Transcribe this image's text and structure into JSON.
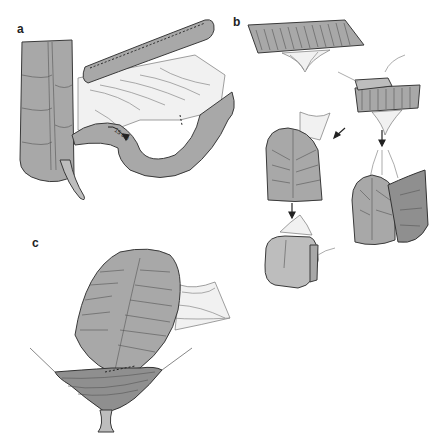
{
  "figure": {
    "panels": [
      {
        "id": "a",
        "label": "a",
        "description": "Colon with mesentery and small bowel loop; measured segment",
        "annotation": "15 cm"
      },
      {
        "id": "b",
        "label": "b",
        "description": "Sequence of bowel segment folding into pouch, with arrows indicating steps"
      },
      {
        "id": "c",
        "label": "c",
        "description": "Folded pouch anastomosed to opening below"
      }
    ],
    "colors": {
      "tissue": "#a8a8a8",
      "outline": "#3a3a3a",
      "mesentery": "#f1f1f1",
      "background": "#ffffff"
    }
  }
}
